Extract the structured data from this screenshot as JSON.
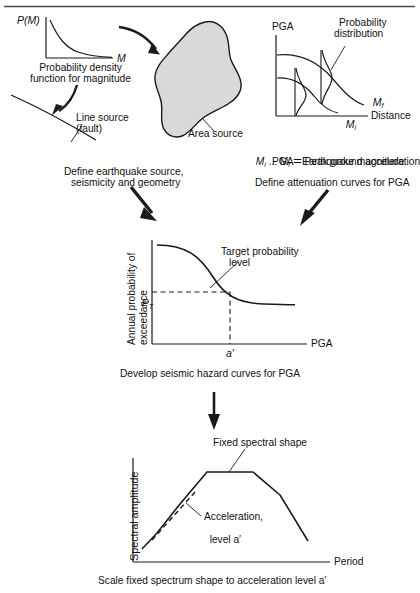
{
  "figure": {
    "top_rule": true,
    "line_color": "#1a1a1a",
    "fill_color": "#d9d9d9",
    "background": "#ffffff"
  },
  "step1": {
    "pdf_chart": {
      "y_axis_label": "P(M)",
      "x_axis_label": "M",
      "caption_line1": "Probability density",
      "caption_line2": "function for magnitude",
      "curve_type": "decaying-exponential"
    },
    "line_source": {
      "label_line1": "Line source",
      "label_line2": "(fault)"
    },
    "area_source": {
      "label": "Area source"
    },
    "caption_line1": "Define earthquake source,",
    "caption_line2": "seismicity and geometry"
  },
  "step2": {
    "attenuation_chart": {
      "y_axis_label": "PGA",
      "x_axis_label": "Distance",
      "curve_upper_label": "M",
      "curve_upper_sub": "f",
      "curve_lower_label": "M",
      "curve_lower_sub": "i",
      "annotation_line1": "Probability",
      "annotation_line2": "distribution"
    },
    "legend_line1_a": "M",
    "legend_line1_sub1": "i",
    "legend_line1_b": " ... M",
    "legend_line1_sub2": "f",
    "legend_line1_c": " = Earthquake magnitude",
    "legend_line2": "PGA = Peak ground acceleration",
    "caption": "Define attenuation curves for PGA"
  },
  "step3": {
    "hazard_chart": {
      "y_axis_label_line1": "Annual probability of",
      "y_axis_label_line2": "exceedance",
      "x_axis_label": "PGA",
      "target_level_label_line1": "Target probability",
      "target_level_label_line2": "level",
      "p_label": "P",
      "p_sub": "T",
      "a_label": "a′",
      "curve_type": "sigmoid-decreasing",
      "dashed_guides": true
    },
    "caption": "Develop seismic hazard curves for PGA"
  },
  "step4": {
    "spectrum_chart": {
      "y_axis_label": "Spectral amplitude",
      "x_axis_label": "Period",
      "shape_label": "Fixed spectral shape",
      "accel_label_line1": "Acceleration,",
      "accel_label_line2": "level a′",
      "shape_type": "trapezoid-spectrum",
      "dashed_segment": true
    },
    "caption": "Scale fixed spectrum shape to acceleration level a′"
  },
  "arrows": {
    "pdf_to_area": "curved-arrow-right",
    "pdf_to_fault": "curved-arrow-down-left",
    "sources_to_hazard": "thick-diagonal-arrow-down-right",
    "attenuation_to_hazard": "thick-diagonal-arrow-down-left",
    "hazard_to_spectrum": "vertical-arrow-down"
  }
}
